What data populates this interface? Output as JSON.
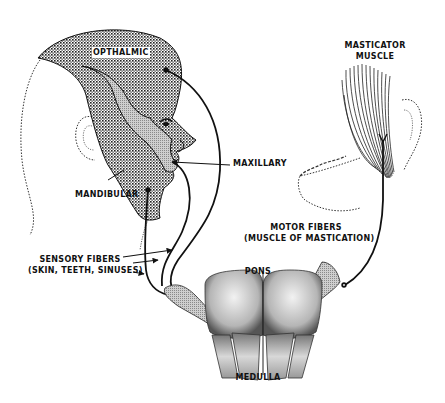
{
  "diagram": {
    "colors": {
      "background": "#ffffff",
      "ink": "#111111",
      "sensory_region_fill": "#9a9a9a",
      "maxillary_region_fill": "#bdbdbd"
    },
    "labels": {
      "ophthalmic": "OPTHALMIC",
      "maxillary": "MAXILLARY",
      "mandibular": "MANDIBULAR",
      "masticator_line1": "MASTICATOR",
      "masticator_line2": "MUSCLE",
      "sensory_line1": "SENSORY FIBERS",
      "sensory_line2": "(SKIN, TEETH, SINUSES)",
      "motor_line1": "MOTOR FIBERS",
      "motor_line2": "(MUSCLE OF MASTICATION)",
      "pons": "PONS",
      "medulla": "MEDULLA"
    },
    "parts": [
      {
        "name": "head-profile",
        "type": "outline"
      },
      {
        "name": "ophthalmic-region",
        "type": "stippled-area"
      },
      {
        "name": "maxillary-region",
        "type": "shaded-area"
      },
      {
        "name": "mandibular-region",
        "type": "stippled-area"
      },
      {
        "name": "masticator-muscle",
        "type": "fibrous-muscle"
      },
      {
        "name": "jaw-outline",
        "type": "outline"
      },
      {
        "name": "brainstem-pons",
        "type": "stippled-structure"
      },
      {
        "name": "brainstem-medulla",
        "type": "stippled-structure"
      },
      {
        "name": "sensory-nerve-fibers",
        "type": "nerve-lines",
        "count": 3
      },
      {
        "name": "motor-nerve-fiber",
        "type": "nerve-line",
        "count": 1
      }
    ]
  }
}
